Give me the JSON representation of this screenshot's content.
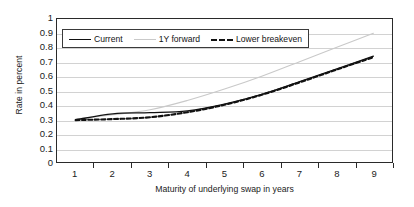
{
  "chart_data": {
    "type": "line",
    "title": "",
    "xlabel": "Maturity of underlying swap in years",
    "ylabel": "Rate in percent",
    "xlim": [
      0.5,
      9.5
    ],
    "ylim": [
      0,
      1
    ],
    "grid": true,
    "legend_position": "top-left-inside",
    "xticklabels": [
      "1",
      "2",
      "3",
      "4",
      "5",
      "6",
      "7",
      "8",
      "9"
    ],
    "yticklabels": [
      "0",
      "0.1",
      "0.2",
      "0.3",
      "0.4",
      "0.5",
      "0.6",
      "0.7",
      "0.8",
      "0.9",
      "1"
    ],
    "x": [
      1,
      2,
      3,
      4,
      5,
      6,
      7,
      8,
      9
    ],
    "series": [
      {
        "name": "Current",
        "style": "solid",
        "color": "#111111",
        "values": [
          0.295,
          0.337,
          0.345,
          0.358,
          0.405,
          0.473,
          0.56,
          0.65,
          0.74
        ]
      },
      {
        "name": "1Y forward",
        "style": "solid-light",
        "color": "#c9c9c9",
        "values": [
          0.3,
          0.33,
          0.365,
          0.43,
          0.51,
          0.6,
          0.7,
          0.8,
          0.9
        ]
      },
      {
        "name": "Lower breakeven",
        "style": "dashed",
        "color": "#111111",
        "values": [
          0.293,
          0.3,
          0.313,
          0.348,
          0.4,
          0.47,
          0.555,
          0.645,
          0.733
        ]
      }
    ]
  },
  "legend": {
    "items": [
      {
        "label": "Current"
      },
      {
        "label": "1Y forward"
      },
      {
        "label": "Lower breakeven"
      }
    ]
  }
}
